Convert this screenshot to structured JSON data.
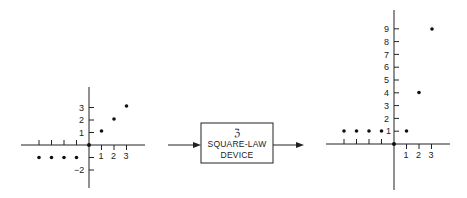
{
  "diagram": {
    "block": {
      "symbol": "ʕ",
      "symbol_display": "ℨ",
      "line1": "SQUARE-LAW",
      "line2": "DEVICE"
    },
    "input_plot": {
      "x_tick_labels": [
        "1",
        "2",
        "3"
      ],
      "y_tick_labels": [
        "3",
        "2",
        "1",
        "−2"
      ],
      "points": [
        [
          -4,
          -1
        ],
        [
          -3,
          -1
        ],
        [
          -2,
          -1
        ],
        [
          -1,
          -1
        ],
        [
          0,
          0
        ],
        [
          1,
          1
        ],
        [
          2,
          2
        ],
        [
          3,
          3
        ]
      ]
    },
    "output_plot": {
      "x_tick_labels": [
        "1",
        "2",
        "3"
      ],
      "y_tick_labels": [
        "9",
        "8",
        "7",
        "6",
        "5",
        "4",
        "3",
        "2",
        "1"
      ],
      "points": [
        [
          -4,
          1
        ],
        [
          -3,
          1
        ],
        [
          -2,
          1
        ],
        [
          -1,
          1
        ],
        [
          0,
          0
        ],
        [
          1,
          1
        ],
        [
          2,
          4
        ],
        [
          3,
          9
        ]
      ]
    }
  }
}
